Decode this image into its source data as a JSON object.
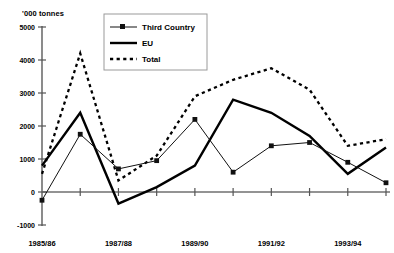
{
  "chart_data": {
    "type": "line",
    "title": "",
    "ylabel": "'000 tonnes",
    "xlabel": "",
    "ylim": [
      -1000,
      5000
    ],
    "yticks": [
      5000,
      4000,
      3000,
      2000,
      1000,
      0,
      -1000
    ],
    "ytick_labels": [
      "5000",
      "4000",
      "3000",
      "2000",
      "1000",
      "0",
      "-1000"
    ],
    "grid": false,
    "legend_position": "top-center",
    "x": [
      "1985/86",
      "1986/87",
      "1987/88",
      "1988/89",
      "1989/90",
      "1990/91",
      "1991/92",
      "1992/93",
      "1993/94",
      "1994/95"
    ],
    "xtick_labels_shown": [
      "1985/86",
      "1987/88",
      "1989/90",
      "1991/92",
      "1993/94"
    ],
    "categories": [
      "1985/86",
      "1986/87",
      "1987/88",
      "1988/89",
      "1989/90",
      "1990/91",
      "1991/92",
      "1992/93",
      "1993/94",
      "1994/95"
    ],
    "series": [
      {
        "name": "Third Country",
        "style": "thin-line-with-square-markers",
        "values": [
          -250,
          1750,
          700,
          950,
          2200,
          600,
          1400,
          1500,
          900,
          280
        ]
      },
      {
        "name": "EU",
        "style": "thick-solid-line",
        "values": [
          800,
          2400,
          -350,
          150,
          800,
          2800,
          2400,
          1700,
          550,
          1350
        ]
      },
      {
        "name": "Total",
        "style": "dotted-line",
        "values": [
          550,
          4200,
          350,
          1100,
          2900,
          3400,
          3750,
          3100,
          1400,
          1600
        ]
      }
    ]
  },
  "legend": {
    "items": [
      {
        "label": "Third Country"
      },
      {
        "label": "EU"
      },
      {
        "label": "Total"
      }
    ]
  },
  "colors": {
    "line": "#000000",
    "axis": "#6f6f6f",
    "background": "#ffffff"
  }
}
